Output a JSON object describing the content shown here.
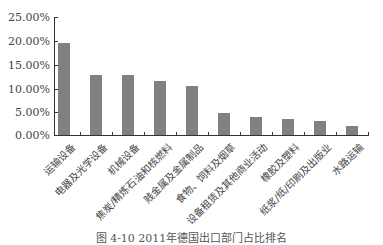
{
  "chart_data": {
    "type": "bar",
    "title": "",
    "xlabel": "",
    "ylabel": "",
    "ylim": [
      0,
      25
    ],
    "yticks": [
      "0.00%",
      "5.00%",
      "10.00%",
      "15.00%",
      "20.00%",
      "25.00%"
    ],
    "grid": false,
    "legend": null,
    "bar_color": "#808080",
    "categories": [
      "运输设备",
      "电器及光学设备",
      "机械设备",
      "焦炭/精炼石油和核燃料",
      "贱金属及金属制品",
      "食物、饲料及烟草",
      "设备租赁及其他商业活动",
      "橡胶及塑料",
      "纸浆/纸/印刷及出版业",
      "水路运输"
    ],
    "values": [
      19.5,
      12.8,
      12.7,
      11.5,
      10.4,
      4.6,
      3.9,
      3.4,
      3.0,
      2.0
    ],
    "caption": "图 4-10  2011年德国出口部门占比排名"
  }
}
